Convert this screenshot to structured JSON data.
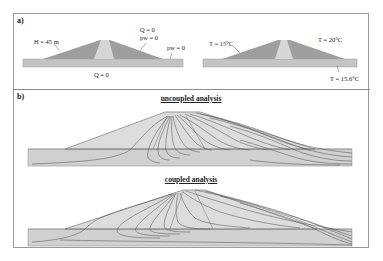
{
  "panel_a": {
    "label": "a)",
    "left": {
      "height_label": "H = 45 m",
      "crest_q": "Q = 0",
      "crest_pw": "pw = 0",
      "downstream_pw": "pw = 0",
      "base_q": "Q = 0"
    },
    "right": {
      "upstream_temp": "T = 15°C",
      "downstream_temp": "T = 20°C",
      "foundation_temp": "T = 15.6°C"
    }
  },
  "panel_b": {
    "label": "b)",
    "uncoupled_title": "uncoupled analysis",
    "coupled_title": "coupled analysis"
  },
  "colors": {
    "frame": "#9a9a9a",
    "shell": "#9e9e9e",
    "core": "#d6d6d6",
    "foundation": "#c4c4c4",
    "contour": "#4a4a4a",
    "contour_fill": "#cfcfcf"
  }
}
